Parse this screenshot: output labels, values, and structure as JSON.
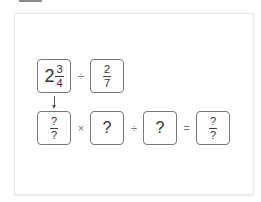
{
  "row1": {
    "mixed": {
      "whole": "2",
      "numerator": "3",
      "denominator": "4"
    },
    "operator": "÷",
    "fraction": {
      "numerator": "2",
      "denominator": "7"
    }
  },
  "row2": {
    "box1": {
      "numerator": "?",
      "denominator": "?"
    },
    "op1": "×",
    "box2": "?",
    "op2": "÷",
    "box3": "?",
    "op3": "=",
    "box4": {
      "numerator": "?",
      "denominator": "?"
    }
  },
  "arrow_icon": "down-arrow-icon"
}
